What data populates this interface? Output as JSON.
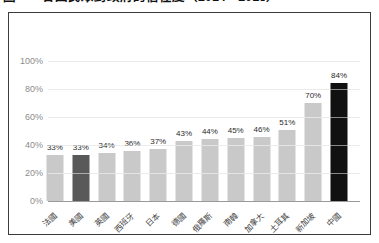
{
  "title": "圖一　各國民眾對政府的信任度（2014—2015）",
  "chart_data": {
    "type": "bar",
    "title": "各國民眾對政府的信任度",
    "categories": [
      "法國",
      "美國",
      "英國",
      "西班牙",
      "日本",
      "德國",
      "俄羅斯",
      "南韓",
      "加拿大",
      "土耳其",
      "新加坡",
      "中國"
    ],
    "values": [
      33,
      33,
      34,
      36,
      37,
      43,
      44,
      45,
      46,
      51,
      70,
      84
    ],
    "value_labels": [
      "33%",
      "33%",
      "34%",
      "36%",
      "37%",
      "43%",
      "44%",
      "45%",
      "46%",
      "51%",
      "70%",
      "84%"
    ],
    "y_ticks": [
      "0%",
      "20%",
      "40%",
      "60%",
      "80%",
      "100%"
    ],
    "ylim": [
      0,
      100
    ],
    "grid": true,
    "legend": "none",
    "colors": {
      "default": "#c9c9c9",
      "highlight_secondary": "#595959",
      "highlight_primary": "#111111"
    },
    "highlight_indices": {
      "secondary": 1,
      "primary": 11
    }
  }
}
